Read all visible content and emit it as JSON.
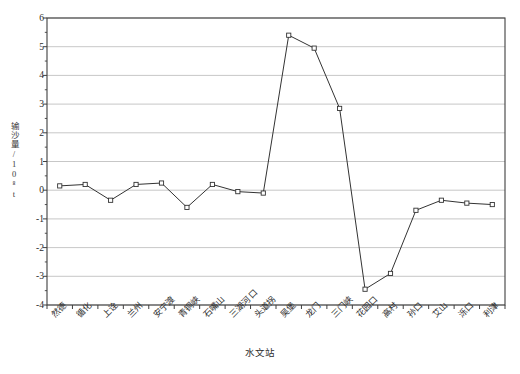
{
  "chart_data": {
    "type": "line",
    "title": "",
    "subtitle": "",
    "xlabel": "水文站",
    "ylabel": "输沙量/10⁸t",
    "categories": [
      "然德",
      "循化",
      "上诠",
      "兰州",
      "安宁渡",
      "青铜峡",
      "石嘴山",
      "三湖河口",
      "头道拐",
      "吴堡",
      "龙门",
      "三门峡",
      "花园口",
      "高村",
      "孙口",
      "艾山",
      "泺口",
      "利津"
    ],
    "values": [
      0.15,
      0.2,
      -0.35,
      0.2,
      0.25,
      -0.6,
      0.2,
      -0.05,
      -0.1,
      5.4,
      4.95,
      2.85,
      -3.45,
      -2.9,
      -0.7,
      -0.35,
      -0.45,
      -0.5
    ],
    "ylim": [
      -4,
      6
    ],
    "yticks": [
      6,
      5,
      4,
      3,
      2,
      1,
      0,
      -1,
      -2,
      -3,
      -4
    ],
    "ytick_labels": [
      "6",
      "5",
      "4",
      "3",
      "2",
      "1",
      "0",
      "-1",
      "-2",
      "-3",
      "-4"
    ],
    "y_minor_step": 0.5,
    "grid": "horizontal",
    "legend": "none",
    "marker": "open-square",
    "line_color": "#333333",
    "grid_color": "#b9b9b9",
    "axis_color": "#3f3f3f",
    "marker_fill": "#ffffff"
  },
  "figure": {
    "caption_partial": ""
  }
}
